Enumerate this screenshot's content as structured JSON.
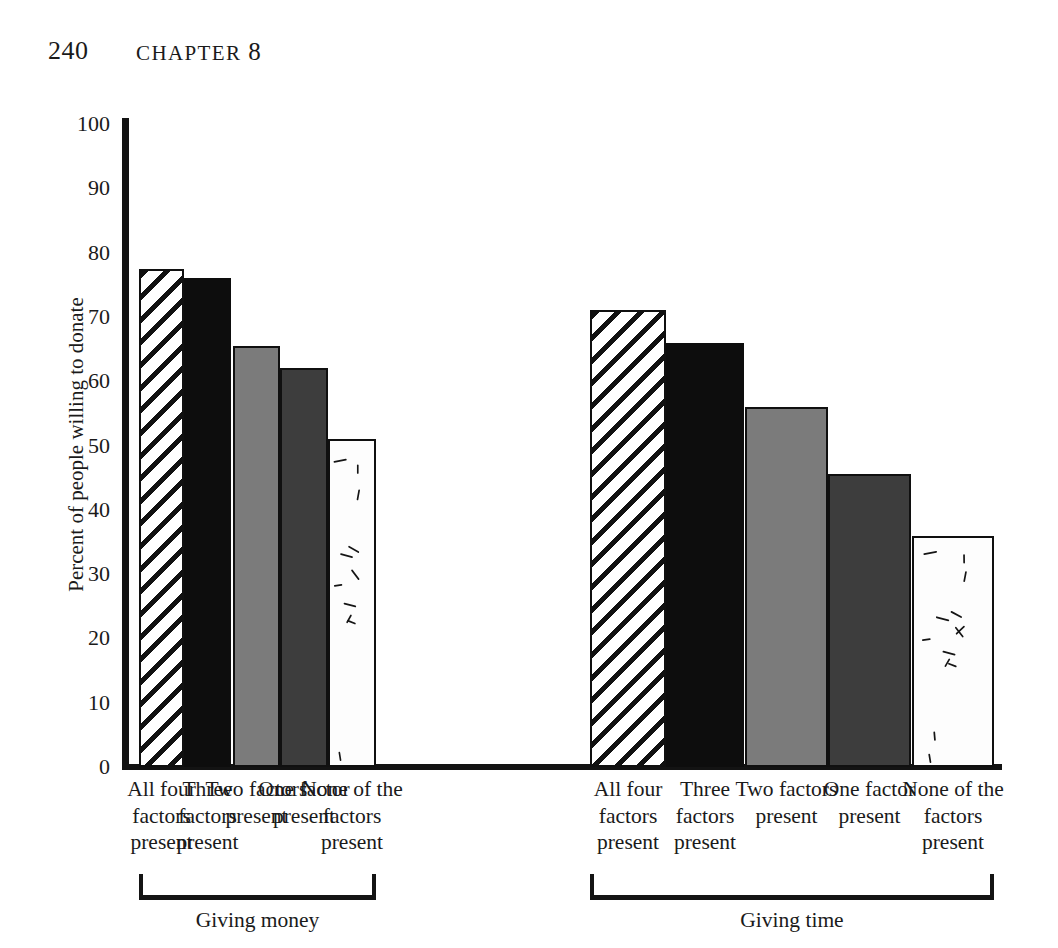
{
  "page": {
    "folio": "240",
    "running_head": "CHAPTER",
    "chapter_number": "8"
  },
  "chart_data": {
    "type": "bar",
    "title": "",
    "xlabel": "",
    "ylabel": "Percent of people willing to donate",
    "ylim": [
      0,
      100
    ],
    "ytick_labels": [
      "100",
      "90",
      "80",
      "70",
      "60",
      "50",
      "40",
      "30",
      "20",
      "10",
      "0"
    ],
    "yticks": [
      100,
      90,
      80,
      70,
      60,
      50,
      40,
      30,
      20,
      10,
      0
    ],
    "grid": false,
    "legend": "none",
    "categories": [
      "All four factors present",
      "Three factors present",
      "Two factors present",
      "One factor present",
      "None of the factors present"
    ],
    "groups": [
      {
        "name": "Giving money",
        "values": [
          77.5,
          76,
          65.5,
          62,
          51
        ]
      },
      {
        "name": "Giving time",
        "values": [
          71,
          66,
          56,
          45.5,
          36
        ]
      }
    ],
    "bar_fills": [
      "diagonal-hatch",
      "solid-black",
      "medium-gray",
      "dark-gray",
      "white-dashes"
    ],
    "colors": {
      "axis": "#131313",
      "outline": "#101010",
      "solid_black": "#0d0d0d",
      "medium_gray": "#7b7b7b",
      "dark_gray": "#3d3d3d",
      "white_fill": "#fdfdfd",
      "background": "#ffffff"
    }
  }
}
